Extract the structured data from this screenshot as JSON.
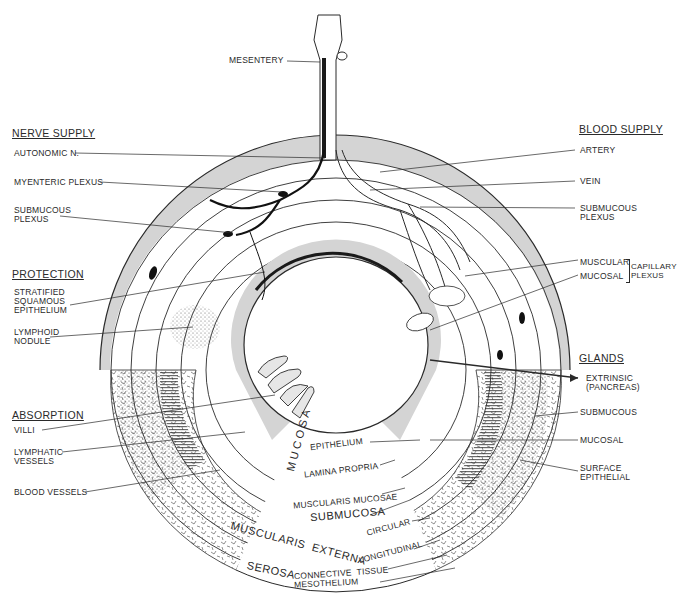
{
  "diagram": {
    "type": "cross-section of digestive tract (general plan)",
    "colors": {
      "ink": "#2a2a2a",
      "shade": "#d4d4d4",
      "paper": "#ffffff"
    }
  },
  "top": {
    "mesentery": "MESENTERY"
  },
  "nerve_supply": {
    "heading": "NERVE SUPPLY",
    "items": [
      "AUTONOMIC N.",
      "MYENTERIC PLEXUS",
      "SUBMUCOUS\nPLEXUS"
    ]
  },
  "protection": {
    "heading": "PROTECTION",
    "items": [
      "STRATIFIED\nSQUAMOUS\nEPITHELIUM",
      "LYMPHOID\nNODULE"
    ]
  },
  "absorption": {
    "heading": "ABSORPTION",
    "items": [
      "VILLI",
      "LYMPHATIC\nVESSELS",
      "BLOOD VESSELS"
    ]
  },
  "blood_supply": {
    "heading": "BLOOD SUPPLY",
    "items": [
      "ARTERY",
      "VEIN",
      "SUBMUCOUS\nPLEXUS",
      "MUSCULAR",
      "MUCOSAL"
    ],
    "capillary_plexus": "CAPILLARY\nPLEXUS"
  },
  "glands": {
    "heading": "GLANDS",
    "items": [
      "EXTRINSIC\n(PANCREAS)",
      "SUBMUCOUS",
      "MUCOSAL",
      "SURFACE\nEPITHELIAL"
    ]
  },
  "layers": {
    "mucosa": "MUCOSA",
    "mucosa_parts": [
      "EPITHELIUM",
      "LAMINA PROPRIA",
      "MUSCULARIS MUCOSAE"
    ],
    "submucosa": "SUBMUCOSA",
    "muscularis_externa": "MUSCULARIS  EXTERNA",
    "muscularis_parts": [
      "CIRCULAR",
      "LONGITUDINAL"
    ],
    "serosa": "SEROSA",
    "serosa_parts": [
      "CONNECTIVE  TISSUE",
      "MESOTHELIUM"
    ]
  }
}
